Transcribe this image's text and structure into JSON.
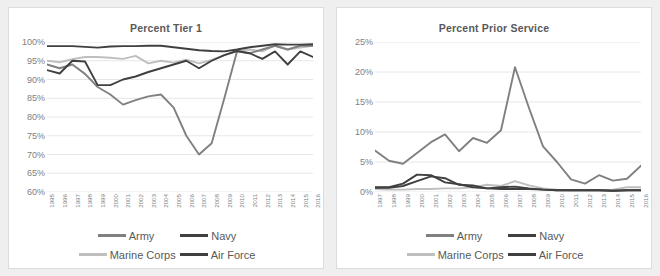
{
  "page": {
    "background": "#efefef",
    "panel_background": "#ffffff",
    "panel_border": "#dcdcdc"
  },
  "series_colors": {
    "army": "#808080",
    "navy": "#404040",
    "marine_corps": "#bfbfbf",
    "air_force": "#404040"
  },
  "legend": {
    "rows": [
      [
        {
          "name": "army",
          "label": "Army",
          "color": "#808080"
        },
        {
          "name": "navy",
          "label": "Navy",
          "color": "#404040"
        }
      ],
      [
        {
          "name": "marine-corps",
          "label": "Marine Corps",
          "color": "#bfbfbf"
        },
        {
          "name": "air-force",
          "label": "Air Force",
          "color": "#404040"
        }
      ]
    ]
  },
  "chart_data": [
    {
      "id": "percent-tier-1",
      "type": "line",
      "title": "Percent Tier 1",
      "xlabel": "",
      "ylabel": "",
      "grid": true,
      "legend_position": "bottom",
      "ylim": [
        60,
        100
      ],
      "ytick_labels": [
        "100%",
        "95%",
        "90%",
        "85%",
        "80%",
        "75%",
        "70%",
        "65%",
        "60%"
      ],
      "yticks": [
        100,
        95,
        90,
        85,
        80,
        75,
        70,
        65,
        60
      ],
      "categories": [
        "1995",
        "1996",
        "1997",
        "1998",
        "1999",
        "2000",
        "2001",
        "2002",
        "2003",
        "2004",
        "2005",
        "2006",
        "2007",
        "2008",
        "2009",
        "2010",
        "2011",
        "2012",
        "2013",
        "2014",
        "2015",
        "2016"
      ],
      "series": [
        {
          "name": "Army",
          "color": "#808080",
          "values": [
            94.0,
            93.0,
            94.0,
            91.5,
            88.0,
            86.0,
            83.3,
            84.5,
            85.5,
            86.0,
            82.5,
            75.0,
            70.0,
            73.0,
            85.0,
            97.5,
            97.0,
            98.0,
            99.0,
            98.0,
            99.0,
            99.0
          ]
        },
        {
          "name": "Navy",
          "color": "#404040",
          "values": [
            98.9,
            98.9,
            98.9,
            98.7,
            98.5,
            98.8,
            98.9,
            98.9,
            99.0,
            99.0,
            98.6,
            98.2,
            97.8,
            97.6,
            97.5,
            98.0,
            98.6,
            99.0,
            99.4,
            99.3,
            99.3,
            99.4
          ]
        },
        {
          "name": "Marine Corps",
          "color": "#bfbfbf",
          "values": [
            95.0,
            94.6,
            95.4,
            96.0,
            96.0,
            95.8,
            95.5,
            96.3,
            94.3,
            95.0,
            94.5,
            95.3,
            94.3,
            95.2,
            96.5,
            97.6,
            98.0,
            97.5,
            99.0,
            98.0,
            98.5,
            99.0
          ]
        },
        {
          "name": "Air Force",
          "color": "#404040",
          "values": [
            92.5,
            91.6,
            95.0,
            94.8,
            88.5,
            88.5,
            90.0,
            90.8,
            92.0,
            93.0,
            94.0,
            95.0,
            93.0,
            95.0,
            96.5,
            97.6,
            97.0,
            95.5,
            97.5,
            94.0,
            97.5,
            96.0
          ]
        }
      ]
    },
    {
      "id": "percent-prior-service",
      "type": "line",
      "title": "Percent Prior Service",
      "xlabel": "",
      "ylabel": "",
      "grid": true,
      "legend_position": "bottom",
      "ylim": [
        0,
        25
      ],
      "ytick_labels": [
        "25%",
        "20%",
        "15%",
        "10%",
        "5%",
        "0%"
      ],
      "yticks": [
        25,
        20,
        15,
        10,
        5,
        0
      ],
      "categories": [
        "1997",
        "1998",
        "1999",
        "2000",
        "2001",
        "2002",
        "2003",
        "2004",
        "2005",
        "2006",
        "2007",
        "2008",
        "2009",
        "2010",
        "2011",
        "2012",
        "2013",
        "2014",
        "2015",
        "2016"
      ],
      "series": [
        {
          "name": "Army",
          "color": "#808080",
          "values": [
            6.9,
            5.2,
            4.7,
            6.5,
            8.3,
            9.6,
            6.8,
            9.0,
            8.2,
            10.3,
            20.8,
            14.0,
            7.6,
            5.0,
            2.1,
            1.4,
            2.8,
            1.9,
            2.2,
            4.4
          ]
        },
        {
          "name": "Navy",
          "color": "#404040",
          "values": [
            0.8,
            0.8,
            1.4,
            2.9,
            2.8,
            1.6,
            1.3,
            0.8,
            0.6,
            0.8,
            0.9,
            0.6,
            0.4,
            0.3,
            0.3,
            0.3,
            0.3,
            0.2,
            0.3,
            0.3
          ]
        },
        {
          "name": "Marine Corps",
          "color": "#bfbfbf",
          "values": [
            0.5,
            0.4,
            0.4,
            0.5,
            0.5,
            0.6,
            0.6,
            0.8,
            1.2,
            1.0,
            1.8,
            1.1,
            0.6,
            0.4,
            0.3,
            0.3,
            0.3,
            0.4,
            0.8,
            0.8
          ]
        },
        {
          "name": "Air Force",
          "color": "#404040",
          "values": [
            0.7,
            0.7,
            1.0,
            1.8,
            2.6,
            2.3,
            1.2,
            1.1,
            0.6,
            0.5,
            0.5,
            0.5,
            0.4,
            0.3,
            0.3,
            0.3,
            0.3,
            0.2,
            0.3,
            0.3
          ]
        }
      ]
    }
  ]
}
